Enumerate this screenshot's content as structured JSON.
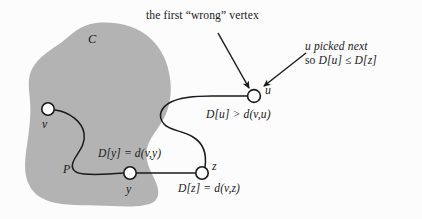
{
  "figure": {
    "title_annotation": "the first “wrong” vertex",
    "side_annotation_line1": "u picked next",
    "side_annotation_line2_prefix": "so ",
    "side_annotation_line2": "D[u] ≤ D[z]",
    "background_color": "#fcfcfc",
    "region_fill_color": "#b3b3b3",
    "stroke_color": "#1a1a1a",
    "vertex_fill_color": "#ffffff"
  },
  "region": {
    "label": "C",
    "name": "cloud-of-settled-vertices"
  },
  "vertices": [
    {
      "id": "v",
      "label": "v",
      "x": 48,
      "y": 109
    },
    {
      "id": "y",
      "label": "y",
      "x": 130,
      "y": 173
    },
    {
      "id": "z",
      "label": "z",
      "x": 202,
      "y": 173
    },
    {
      "id": "u",
      "label": "u",
      "x": 254,
      "y": 96
    }
  ],
  "path": {
    "label": "P"
  },
  "edge_labels": {
    "Du": "D[u] > d(v,u)",
    "Dy": "D[y] = d(v,y)",
    "Dz": "D[z] = d(v,z)"
  },
  "arrows": [
    {
      "name": "arrow-first-wrong-vertex-to-u",
      "from": [
        218,
        33
      ],
      "to": [
        250,
        89
      ]
    },
    {
      "name": "arrow-u-picked-next-to-u",
      "from": [
        306,
        53
      ],
      "to": [
        263,
        87
      ]
    }
  ]
}
